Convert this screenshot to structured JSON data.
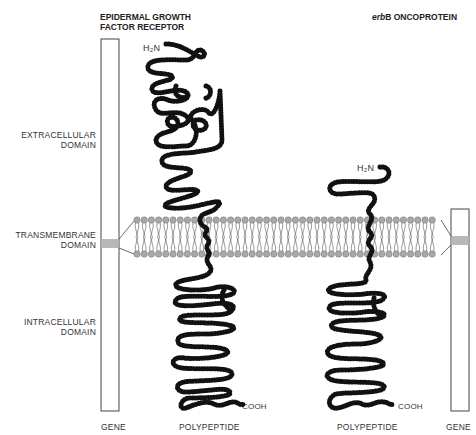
{
  "titles": {
    "egfr_line1": "EPIDERMAL GROWTH",
    "egfr_line2": "FACTOR RECEPTOR",
    "erbb_italic": "erb",
    "erbb_rest": "B ONCOPROTEIN"
  },
  "domains": {
    "extracellular_line1": "EXTRACELLULAR",
    "extracellular_line2": "DOMAIN",
    "transmembrane_line1": "TRANSMEMBRANE",
    "transmembrane_line2": "DOMAIN",
    "intracellular_line1": "INTRACELLULAR",
    "intracellular_line2": "DOMAIN"
  },
  "termini": {
    "egfr_n": "H₂N",
    "egfr_c": "COOH",
    "erbb_n": "H₂N",
    "erbb_c": "COOH"
  },
  "bottom_labels": {
    "gene_left": "GENE",
    "polypeptide_left": "POLYPEPTIDE",
    "polypeptide_right": "POLYPEPTIDE",
    "gene_right": "GENE"
  },
  "colors": {
    "chain": "#111111",
    "lipid_head": "#a8a8a8",
    "gene_band": "#b8b8b8",
    "outline": "#444444"
  }
}
